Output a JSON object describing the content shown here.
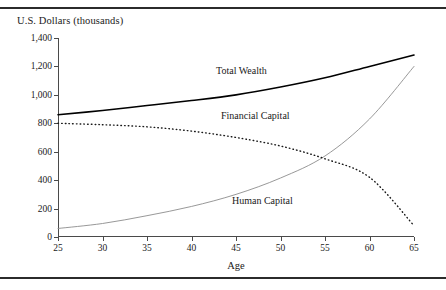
{
  "figure": {
    "y_axis_title": "U.S. Dollars (thousands)",
    "x_axis_title": "Age"
  },
  "chart_data": {
    "type": "line",
    "title": "",
    "xlabel": "Age",
    "ylabel": "U.S. Dollars (thousands)",
    "xlim": [
      25,
      65
    ],
    "ylim": [
      0,
      1400
    ],
    "xticks": [
      25,
      30,
      35,
      40,
      45,
      50,
      55,
      60,
      65
    ],
    "xtick_labels": [
      "25",
      "30",
      "35",
      "40",
      "45",
      "50",
      "55",
      "60",
      "65"
    ],
    "yticks": [
      0,
      200,
      400,
      600,
      800,
      1000,
      1200,
      1400
    ],
    "ytick_labels": [
      "0",
      "200",
      "400",
      "600",
      "800",
      "1,000",
      "1,200",
      "1,400"
    ],
    "grid": false,
    "legend_position": "inline-labels",
    "x": [
      25,
      30,
      35,
      40,
      45,
      50,
      55,
      60,
      65
    ],
    "series": [
      {
        "name": "Total Wealth",
        "style": "solid",
        "color": "#000000",
        "width": 1.6,
        "values": [
          860,
          890,
          925,
          960,
          1000,
          1055,
          1120,
          1200,
          1280
        ]
      },
      {
        "name": "Financial Capital",
        "style": "solid",
        "color": "#8c8c8c",
        "width": 0.9,
        "values": [
          60,
          95,
          150,
          215,
          300,
          415,
          570,
          830,
          1200
        ]
      },
      {
        "name": "Human Capital",
        "style": "dotted",
        "color": "#1a1a1a",
        "width": 1.4,
        "values": [
          800,
          790,
          775,
          745,
          700,
          640,
          550,
          420,
          80
        ]
      }
    ],
    "annotations": [
      {
        "text": "Total Wealth",
        "series": "Total Wealth"
      },
      {
        "text": "Financial Capital",
        "series": "Financial Capital"
      },
      {
        "text": "Human Capital",
        "series": "Human Capital"
      }
    ]
  }
}
